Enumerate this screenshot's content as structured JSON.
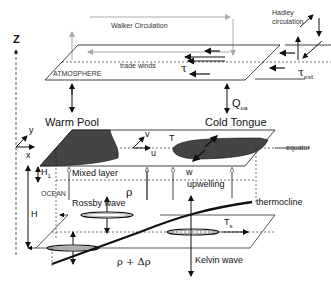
{
  "diagram": {
    "axes": {
      "z": "Z",
      "y": "y",
      "x": "x"
    },
    "atmosphere": {
      "label": "ATMOSPHERE",
      "walker": "Walker Circulation",
      "trade_winds": "trade winds",
      "tau": "τ",
      "hadley": "Hadley",
      "hadley2": "circulation",
      "tau_ext": "τ",
      "tau_ext_sub": "ext"
    },
    "coupling": {
      "warm_pool": "Warm Pool",
      "cold_tongue": "Cold Tongue",
      "q": "Q",
      "q_sub": "oa"
    },
    "mixed_layer": {
      "v": "v",
      "u": "u",
      "T": "T",
      "equator": "equator",
      "h1": "H",
      "h1_sub": "1",
      "label": "Mixed layer",
      "w": "w",
      "upwelling": "upwelling"
    },
    "ocean": {
      "label": "OCEAN",
      "rho": "ρ",
      "H": "H",
      "rossby": "Rossby wave",
      "thermocline": "thermocline",
      "ts": "T",
      "ts_sub": "s",
      "rho_delta": "ρ + Δρ",
      "kelvin": "Kelvin wave"
    },
    "colors": {
      "line": "#111111",
      "gray_arrow": "#aaaaaa",
      "fill": "#444444"
    }
  }
}
